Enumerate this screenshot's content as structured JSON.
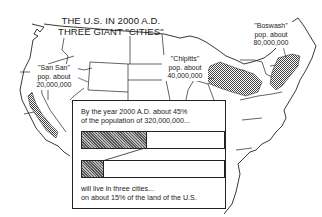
{
  "title": {
    "line1": "THE U.S. IN 2000 A.D.",
    "line2": "THREE GIANT \"CITIES\""
  },
  "cities": [
    {
      "name": "\"San San\"",
      "pop_label": "pop. about",
      "pop": "20,000,000"
    },
    {
      "name": "\"Chipitts\"",
      "pop_label": "pop. about",
      "pop": "40,000,000"
    },
    {
      "name": "\"Boswash\"",
      "pop_label": "pop. about",
      "pop": "80,000,000"
    }
  ],
  "inset": {
    "top_line1": "By the year 2000 A.D. about 45%",
    "top_line2": "of the population of 320,000,000...",
    "bottom_line1": "will live in three cities...",
    "bottom_line2": "on about 15% of the land of the U.S.",
    "population_share_pct": 45,
    "land_share_pct": 15
  },
  "colors": {
    "ink": "#1a1a1a",
    "paper": "#ffffff",
    "shade": "#888888"
  }
}
